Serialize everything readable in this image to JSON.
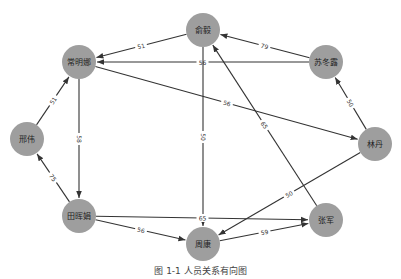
{
  "diagram": {
    "type": "directed-weighted-graph",
    "caption": "图 1-1  人员关系有向图",
    "colors": {
      "node_fill": "#9e9e9e",
      "edge": "#333333",
      "background": "#ffffff"
    },
    "nodes": [
      {
        "id": "changmingna",
        "label": "常明娜",
        "x": 79,
        "y": 62
      },
      {
        "id": "yuyi",
        "label": "俞毅",
        "x": 203,
        "y": 30
      },
      {
        "id": "sudonglu",
        "label": "苏冬露",
        "x": 326,
        "y": 62
      },
      {
        "id": "lindan",
        "label": "林丹",
        "x": 375,
        "y": 144
      },
      {
        "id": "xingwei",
        "label": "邢伟",
        "x": 27,
        "y": 139
      },
      {
        "id": "tianhuijuan",
        "label": "田晖娟",
        "x": 79,
        "y": 216
      },
      {
        "id": "zhoukang",
        "label": "周康",
        "x": 203,
        "y": 244
      },
      {
        "id": "zhangjun",
        "label": "张军",
        "x": 326,
        "y": 220
      }
    ],
    "edges": [
      {
        "from": "yuyi",
        "to": "changmingna",
        "label": "51"
      },
      {
        "from": "sudonglu",
        "to": "changmingna",
        "label": "56"
      },
      {
        "from": "changmingna",
        "to": "lindan",
        "label": "56"
      },
      {
        "from": "sudonglu",
        "to": "yuyi",
        "label": "79"
      },
      {
        "from": "lindan",
        "to": "sudonglu",
        "label": "50"
      },
      {
        "from": "xingwei",
        "to": "changmingna",
        "label": "51"
      },
      {
        "from": "tianhuijuan",
        "to": "xingwei",
        "label": "75"
      },
      {
        "from": "changmingna",
        "to": "tianhuijuan",
        "label": "58"
      },
      {
        "from": "yuyi",
        "to": "zhoukang",
        "label": "50"
      },
      {
        "from": "zhangjun",
        "to": "yuyi",
        "label": "65"
      },
      {
        "from": "lindan",
        "to": "zhoukang",
        "label": "50"
      },
      {
        "from": "tianhuijuan",
        "to": "zhangjun",
        "label": "65"
      },
      {
        "from": "tianhuijuan",
        "to": "zhoukang",
        "label": "56"
      },
      {
        "from": "zhoukang",
        "to": "zhangjun",
        "label": "59"
      }
    ]
  }
}
